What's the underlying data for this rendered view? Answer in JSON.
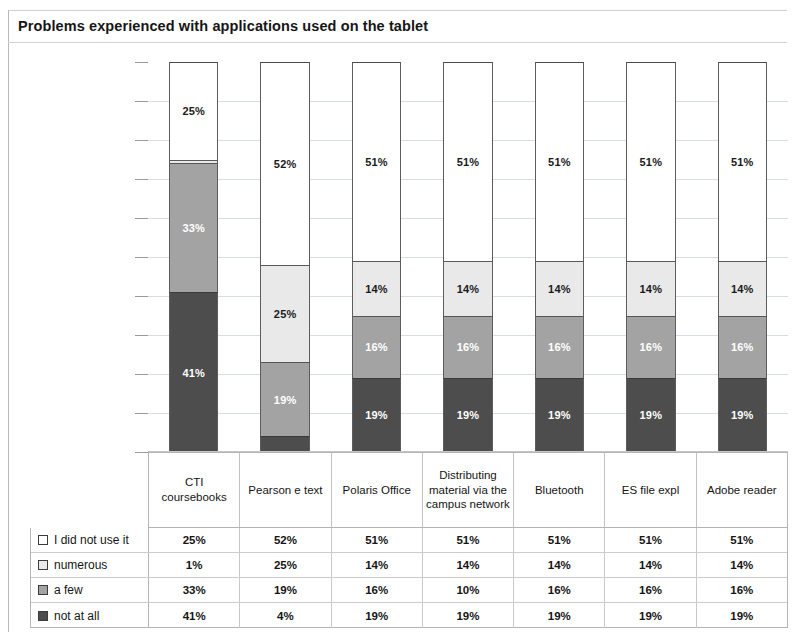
{
  "title": "Problems experienced with applications used on the tablet",
  "chart_data": {
    "type": "bar",
    "title": "Problems experienced with applications used on the tablet",
    "subtype": "stacked-100-percent",
    "xlabel": "",
    "ylabel": "",
    "ylim": [
      0,
      100
    ],
    "grid": true,
    "legend_position": "bottom-table",
    "categories": [
      "CTI coursebooks",
      "Pearson e text",
      "Polaris Office",
      "Distributing material via the campus network",
      "Bluetooth",
      "ES file expl",
      "Adobe reader"
    ],
    "series": [
      {
        "name": "not at all",
        "color": "#4d4d4d",
        "values": [
          41,
          4,
          19,
          19,
          19,
          19,
          19
        ],
        "labels": [
          "41%",
          "4%",
          "19%",
          "19%",
          "19%",
          "19%",
          "19%"
        ]
      },
      {
        "name": "a few",
        "color": "#a3a3a3",
        "values": [
          33,
          19,
          16,
          16,
          16,
          16,
          16
        ],
        "labels": [
          "33%",
          "19%",
          "16%",
          "16%",
          "16%",
          "16%",
          "16%"
        ]
      },
      {
        "name": "numerous",
        "color": "#e9e9e9",
        "values": [
          1,
          25,
          14,
          14,
          14,
          14,
          14
        ],
        "labels": [
          "1%",
          "25%",
          "14%",
          "14%",
          "14%",
          "14%",
          "14%"
        ]
      },
      {
        "name": "I did not use it",
        "color": "#ffffff",
        "values": [
          25,
          52,
          51,
          51,
          51,
          51,
          51
        ],
        "labels": [
          "25%",
          "52%",
          "51%",
          "51%",
          "51%",
          "51%",
          "51%"
        ]
      }
    ]
  },
  "category_header": {
    "cells": [
      "CTI coursebooks",
      "Pearson e text",
      "Polaris Office",
      "Distributing material via the campus network",
      "Bluetooth",
      "ES file expl",
      "Adobe reader"
    ]
  },
  "data_table": {
    "rows": [
      {
        "legend": "I did not use it",
        "swatch": "didnot",
        "values": [
          "25%",
          "52%",
          "51%",
          "51%",
          "51%",
          "51%",
          "51%"
        ]
      },
      {
        "legend": "numerous",
        "swatch": "numerous",
        "values": [
          "1%",
          "25%",
          "14%",
          "14%",
          "14%",
          "14%",
          "14%"
        ]
      },
      {
        "legend": "a few",
        "swatch": "afew",
        "values": [
          "33%",
          "19%",
          "16%",
          "10%",
          "16%",
          "16%",
          "16%"
        ]
      },
      {
        "legend": "not at all",
        "swatch": "notatall",
        "values": [
          "41%",
          "4%",
          "19%",
          "19%",
          "19%",
          "19%",
          "19%"
        ]
      }
    ]
  }
}
